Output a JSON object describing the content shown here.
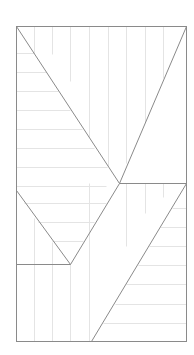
{
  "diagram": {
    "width": 194,
    "height": 355,
    "colors": {
      "background": "#ffffff",
      "main_stroke": "#8a8a8a",
      "grid_stroke": "#e4e4e4"
    },
    "frame": {
      "x": 16,
      "y": 26,
      "w": 170,
      "h": 315
    },
    "main_lines": [
      [
        16,
        26,
        119,
        183
      ],
      [
        186,
        26,
        119,
        183
      ],
      [
        119,
        183,
        186,
        183
      ],
      [
        16,
        190,
        70,
        264
      ],
      [
        119,
        183,
        70,
        264
      ],
      [
        16,
        264,
        70,
        264
      ],
      [
        186,
        183,
        91,
        341
      ]
    ],
    "grid_lines": [
      [
        16,
        53,
        34,
        53
      ],
      [
        16,
        72,
        46,
        72
      ],
      [
        16,
        91,
        58,
        91
      ],
      [
        16,
        110,
        70,
        110
      ],
      [
        16,
        129,
        82,
        129
      ],
      [
        16,
        148,
        94,
        148
      ],
      [
        16,
        167,
        107,
        167
      ],
      [
        16,
        186,
        106,
        186
      ],
      [
        34,
        26,
        34,
        53
      ],
      [
        52,
        26,
        52,
        54
      ],
      [
        70,
        26,
        70,
        81
      ],
      [
        89,
        26,
        89,
        137
      ],
      [
        108,
        26,
        108,
        166
      ],
      [
        126,
        26,
        126,
        163
      ],
      [
        145,
        26,
        145,
        122
      ],
      [
        163,
        26,
        163,
        78
      ],
      [
        24,
        203,
        106,
        203
      ],
      [
        38,
        222,
        94,
        222
      ],
      [
        52,
        241,
        83,
        241
      ],
      [
        34,
        218,
        34,
        341
      ],
      [
        52,
        242,
        52,
        341
      ],
      [
        70,
        264,
        70,
        341
      ],
      [
        89,
        183,
        89,
        341
      ],
      [
        126,
        183,
        126,
        246
      ],
      [
        145,
        183,
        145,
        213
      ],
      [
        163,
        183,
        163,
        197
      ],
      [
        172,
        208,
        186,
        208
      ],
      [
        160,
        227,
        186,
        227
      ],
      [
        149,
        246,
        186,
        246
      ],
      [
        138,
        265,
        186,
        265
      ],
      [
        126,
        284,
        186,
        284
      ],
      [
        115,
        304,
        186,
        304
      ],
      [
        103,
        323,
        186,
        323
      ]
    ]
  }
}
